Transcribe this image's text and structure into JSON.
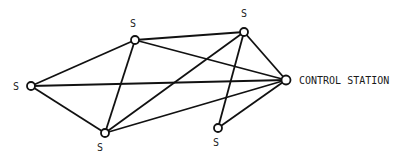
{
  "diagram": {
    "nodes": [
      {
        "id": "s_left",
        "label": "S"
      },
      {
        "id": "s_upper",
        "label": "S"
      },
      {
        "id": "s_bottom",
        "label": "S"
      },
      {
        "id": "s_topright",
        "label": "S"
      },
      {
        "id": "s_bottomright",
        "label": "S"
      },
      {
        "id": "control",
        "label": "CONTROL STATION"
      }
    ],
    "edges": [
      [
        "s_left",
        "s_upper"
      ],
      [
        "s_left",
        "s_bottom"
      ],
      [
        "s_left",
        "control"
      ],
      [
        "s_upper",
        "s_bottom"
      ],
      [
        "s_upper",
        "s_topright"
      ],
      [
        "s_upper",
        "control"
      ],
      [
        "s_bottom",
        "s_topright"
      ],
      [
        "s_bottom",
        "control"
      ],
      [
        "s_topright",
        "control"
      ],
      [
        "s_topright",
        "s_bottomright"
      ],
      [
        "s_bottomright",
        "control"
      ]
    ],
    "colors": {
      "stroke": "#111111",
      "node_fill": "#ffffff"
    }
  }
}
